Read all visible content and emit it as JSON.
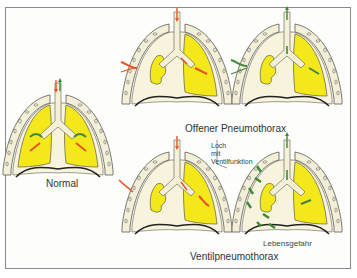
{
  "figure": {
    "labels": {
      "normal": "Normal",
      "open": "Offener Pneumothorax",
      "valve": "Ventilpneumothorax",
      "hole_line1": "Loch",
      "hole_line2": "mit",
      "hole_line3": "Ventilfunktion",
      "danger": "Lebensgefahr"
    },
    "panels": [
      {
        "id": "normal",
        "caption": "Normal",
        "lungs": "both inflated",
        "arrows": [
          "inhale-red",
          "exhale-green"
        ]
      },
      {
        "id": "open-inhale",
        "caption": "Offener Pneumothorax",
        "lungs": "left collapsed",
        "arrows": [
          "inhale-red",
          "chest-wall-red"
        ]
      },
      {
        "id": "open-exhale",
        "caption": "Offener Pneumothorax",
        "lungs": "left collapsed",
        "arrows": [
          "exhale-green",
          "chest-wall-green"
        ]
      },
      {
        "id": "valve-inhale",
        "caption": "Ventilpneumothorax",
        "lungs": "left collapsed",
        "arrows": [
          "inhale-red",
          "chest-wall-red"
        ]
      },
      {
        "id": "valve-exhale",
        "caption": "Ventilpneumothorax",
        "lungs": "left collapsed, trapped air",
        "arrows": [
          "exhale-green",
          "trapped-air-green"
        ]
      }
    ],
    "colors": {
      "lung": "#f4e81a",
      "pleura": "#f3efd8",
      "tissue": "#f7f3dc",
      "outline": "#5a5a50",
      "inhale_arrow": "#e8542a",
      "exhale_arrow": "#3f8a3a",
      "frame": "#8a8a8a"
    }
  }
}
